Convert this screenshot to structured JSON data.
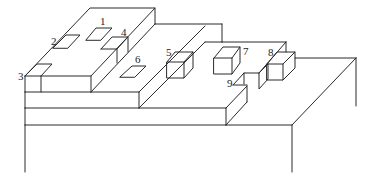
{
  "diagram": {
    "type": "isometric-stepped-structure",
    "stroke_color": "#2a2a2a",
    "background": "#ffffff",
    "labels": [
      {
        "id": "1",
        "text": "1",
        "x": 100,
        "y": 25
      },
      {
        "id": "2",
        "text": "2",
        "x": 51,
        "y": 45
      },
      {
        "id": "3",
        "text": "3",
        "x": 18,
        "y": 80
      },
      {
        "id": "4",
        "text": "4",
        "x": 121,
        "y": 36
      },
      {
        "id": "5",
        "text": "5",
        "x": 166,
        "y": 56
      },
      {
        "id": "6",
        "text": "6",
        "x": 135,
        "y": 63
      },
      {
        "id": "7",
        "text": "7",
        "x": 243,
        "y": 55
      },
      {
        "id": "8",
        "text": "8",
        "x": 268,
        "y": 56
      },
      {
        "id": "9",
        "text": "9",
        "x": 227,
        "y": 87
      }
    ]
  }
}
